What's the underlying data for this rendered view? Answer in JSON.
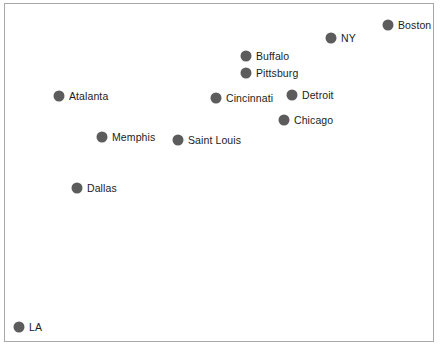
{
  "figure": {
    "width": 441,
    "height": 355,
    "background_color": "#ffffff",
    "frame_color": "#a8a8a8",
    "marker_color": "#5c5c5c",
    "label_color": "#1c1c1c",
    "caption_partial": ""
  },
  "chart_data": {
    "type": "scatter",
    "title": "",
    "xlabel": "",
    "ylabel": "",
    "xlim": [
      0,
      430
    ],
    "ylim": [
      0,
      339
    ],
    "grid": false,
    "legend": "none",
    "axes_visible": false,
    "marker_shape": "circle",
    "marker_color": "#5c5c5c",
    "marker_size_px": 11,
    "points": [
      {
        "label": "Boston",
        "x": 387,
        "y": 24,
        "label_dx": 10,
        "label_dy": 0
      },
      {
        "label": "NY",
        "x": 330,
        "y": 37,
        "label_dx": 10,
        "label_dy": 0
      },
      {
        "label": "Buffalo",
        "x": 245,
        "y": 55,
        "label_dx": 10,
        "label_dy": 0
      },
      {
        "label": "Pittsburg",
        "x": 245,
        "y": 72,
        "label_dx": 10,
        "label_dy": 0
      },
      {
        "label": "Atalanta",
        "x": 58,
        "y": 95,
        "label_dx": 10,
        "label_dy": 0
      },
      {
        "label": "Cincinnati",
        "x": 215,
        "y": 97,
        "label_dx": 10,
        "label_dy": 0
      },
      {
        "label": "Detroit",
        "x": 291,
        "y": 94,
        "label_dx": 10,
        "label_dy": 0
      },
      {
        "label": "Chicago",
        "x": 283,
        "y": 119,
        "label_dx": 10,
        "label_dy": 0
      },
      {
        "label": "Memphis",
        "x": 101,
        "y": 136,
        "label_dx": 10,
        "label_dy": 0
      },
      {
        "label": "Saint Louis",
        "x": 177,
        "y": 139,
        "label_dx": 10,
        "label_dy": 0
      },
      {
        "label": "Dallas",
        "x": 76,
        "y": 187,
        "label_dx": 10,
        "label_dy": 0
      },
      {
        "label": "LA",
        "x": 18,
        "y": 326,
        "label_dx": 10,
        "label_dy": 0
      }
    ]
  }
}
